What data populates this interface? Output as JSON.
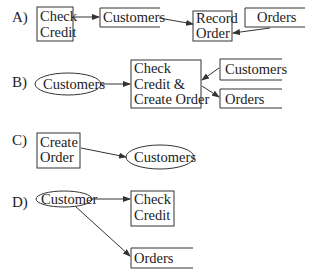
{
  "diagram": {
    "panels": [
      {
        "label": "A)",
        "nodes": [
          {
            "id": "check_credit",
            "type": "process",
            "lines": [
              "Check",
              "Credit"
            ]
          },
          {
            "id": "customers",
            "type": "datastore",
            "lines": [
              "Customers"
            ]
          },
          {
            "id": "record_order",
            "type": "process",
            "lines": [
              "Record",
              "Order"
            ]
          },
          {
            "id": "orders",
            "type": "datastore",
            "lines": [
              "Orders"
            ]
          }
        ],
        "edges": [
          {
            "from": "check_credit",
            "to": "customers"
          },
          {
            "from": "customers",
            "to": "record_order"
          },
          {
            "from": "orders",
            "to": "record_order"
          }
        ]
      },
      {
        "label": "B)",
        "nodes": [
          {
            "id": "customers_entity",
            "type": "external",
            "lines": [
              "Customers"
            ]
          },
          {
            "id": "check_create",
            "type": "process",
            "lines": [
              "Check",
              "Credit &",
              "Create Order"
            ]
          },
          {
            "id": "customers_store",
            "type": "datastore",
            "lines": [
              "Customers"
            ]
          },
          {
            "id": "orders_store",
            "type": "datastore",
            "lines": [
              "Orders"
            ]
          }
        ],
        "edges": [
          {
            "from": "customers_entity",
            "to": "check_create"
          },
          {
            "from": "customers_store",
            "to": "check_create"
          },
          {
            "from": "check_create",
            "to": "orders_store"
          }
        ]
      },
      {
        "label": "C)",
        "nodes": [
          {
            "id": "create_order",
            "type": "process",
            "lines": [
              "Create",
              "Order"
            ]
          },
          {
            "id": "customers_entity",
            "type": "external",
            "lines": [
              "Customers"
            ]
          }
        ],
        "edges": [
          {
            "from": "create_order",
            "to": "customers_entity"
          }
        ]
      },
      {
        "label": "D)",
        "nodes": [
          {
            "id": "customer_entity",
            "type": "external",
            "lines": [
              "Customer"
            ]
          },
          {
            "id": "check_credit",
            "type": "process",
            "lines": [
              "Check",
              "Credit"
            ]
          },
          {
            "id": "orders_store",
            "type": "datastore",
            "lines": [
              "Orders"
            ]
          }
        ],
        "edges": [
          {
            "from": "customer_entity",
            "to": "check_credit"
          },
          {
            "from": "customer_entity",
            "to": "orders_store"
          }
        ]
      }
    ]
  }
}
